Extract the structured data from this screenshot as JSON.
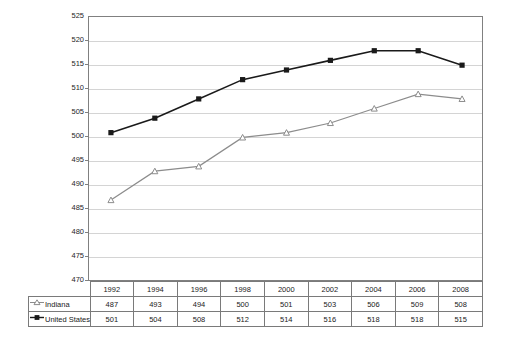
{
  "chart_data": {
    "type": "line",
    "title": "",
    "subtitle": "",
    "xlabel": "",
    "ylabel": "",
    "x": [
      "1992",
      "1994",
      "1996",
      "1998",
      "2000",
      "2002",
      "2004",
      "2006",
      "2008"
    ],
    "categories": [
      "1992",
      "1994",
      "1996",
      "1998",
      "2000",
      "2002",
      "2004",
      "2006",
      "2008"
    ],
    "ylim": [
      470,
      525
    ],
    "yticks": [
      470,
      475,
      480,
      485,
      490,
      495,
      500,
      505,
      510,
      515,
      520,
      525
    ],
    "ytick_labels": [
      "470",
      "475",
      "480",
      "485",
      "490",
      "495",
      "500",
      "505",
      "510",
      "515",
      "520",
      "525"
    ],
    "grid": true,
    "legend_position": "bottom-table",
    "series": [
      {
        "name": "Indiana",
        "values": [
          487,
          493,
          494,
          500,
          501,
          503,
          506,
          509,
          508
        ],
        "color": "#8c8c8c",
        "marker": "open-triangle"
      },
      {
        "name": "United States",
        "values": [
          501,
          504,
          508,
          512,
          514,
          516,
          518,
          518,
          515
        ],
        "color": "#1a1a1a",
        "marker": "filled-square"
      }
    ]
  },
  "table": {
    "header_blank_label": "",
    "year_headers": [
      "1992",
      "1994",
      "1996",
      "1998",
      "2000",
      "2002",
      "2004",
      "2006",
      "2008"
    ],
    "rows": [
      {
        "label": "Indiana",
        "marker": "open-triangle-marker",
        "values": [
          "487",
          "493",
          "494",
          "500",
          "501",
          "503",
          "506",
          "509",
          "508"
        ]
      },
      {
        "label": "United States",
        "marker": "filled-square-marker",
        "values": [
          "501",
          "504",
          "508",
          "512",
          "514",
          "516",
          "518",
          "518",
          "515"
        ]
      }
    ]
  },
  "axis": {
    "y_labels": [
      "525",
      "520",
      "515",
      "510",
      "505",
      "500",
      "495",
      "490",
      "485",
      "480",
      "475",
      "470"
    ]
  },
  "colors": {
    "indiana_line": "#8c8c8c",
    "united_states_line": "#1a1a1a",
    "gridline": "#d4d4d4",
    "axis": "#808080",
    "table_border": "#7a7a7a",
    "background": "#ffffff",
    "text": "#1a1a1a"
  }
}
